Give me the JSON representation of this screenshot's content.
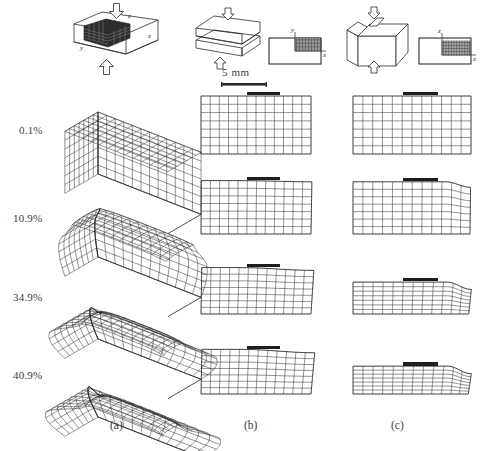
{
  "figure": {
    "width": 494,
    "height": 451,
    "background": "#ffffff",
    "ink_color": "#2a2a2a"
  },
  "strain_levels": [
    {
      "label": "0.1%",
      "value": 0.1
    },
    {
      "label": "10.9%",
      "value": 10.9
    },
    {
      "label": "34.9%",
      "value": 34.9
    },
    {
      "label": "40.9%",
      "value": 40.9
    }
  ],
  "columns": [
    {
      "id": "a",
      "caption": "(a)",
      "view": "3D isometric mesh"
    },
    {
      "id": "b",
      "caption": "(b)",
      "view": "x-y cross-section mesh"
    },
    {
      "id": "c",
      "caption": "(c)",
      "view": "x-z cross-section mesh"
    }
  ],
  "scale_bar": {
    "label": "5 mm"
  },
  "axes": {
    "column_b": {
      "vertical": "y",
      "horizontal": "x"
    },
    "column_c": {
      "vertical": "z",
      "horizontal": "x"
    }
  },
  "icons": {
    "compression_arrow": "compression-arrow-icon",
    "specimen_block": "specimen-block-icon",
    "section_plane": "section-plane-icon"
  },
  "chart_data": {
    "type": "diagram",
    "categories": [
      "0.1%",
      "10.9%",
      "34.9%",
      "40.9%"
    ],
    "series": [
      {
        "name": "(a) 3D isometric mesh",
        "grid": {
          "nx": 12,
          "ny": 7,
          "nz": 7
        },
        "values": [
          {
            "strain": "0.1%",
            "height_fraction": 1.0,
            "edge_rounding": 0.0,
            "barrel": 0.0
          },
          {
            "strain": "10.9%",
            "height_fraction": 0.89,
            "edge_rounding": 0.3,
            "barrel": 0.1
          },
          {
            "strain": "34.9%",
            "height_fraction": 0.65,
            "edge_rounding": 0.7,
            "barrel": 0.26
          },
          {
            "strain": "40.9%",
            "height_fraction": 0.59,
            "edge_rounding": 0.85,
            "barrel": 0.32
          }
        ]
      },
      {
        "name": "(b) x-y cross-section mesh",
        "grid": {
          "nx": 12,
          "ny": 7
        },
        "values": [
          {
            "strain": "0.1%",
            "height_fraction": 1.0,
            "top_tilt": 0.0,
            "shear": 0.0
          },
          {
            "strain": "10.9%",
            "height_fraction": 0.92,
            "top_tilt": 0.04,
            "shear": 0.05
          },
          {
            "strain": "34.9%",
            "height_fraction": 0.8,
            "top_tilt": 0.11,
            "shear": 0.16
          },
          {
            "strain": "40.9%",
            "height_fraction": 0.77,
            "top_tilt": 0.14,
            "shear": 0.21
          }
        ]
      },
      {
        "name": "(c) x-z cross-section mesh",
        "grid": {
          "nx": 12,
          "nz": 7
        },
        "values": [
          {
            "strain": "0.1%",
            "height_fraction": 1.0,
            "corner_round": 0.0,
            "flatten": 0.0
          },
          {
            "strain": "10.9%",
            "height_fraction": 0.9,
            "corner_round": 0.25,
            "flatten": 0.1
          },
          {
            "strain": "34.9%",
            "height_fraction": 0.55,
            "corner_round": 0.55,
            "flatten": 0.45
          },
          {
            "strain": "40.9%",
            "height_fraction": 0.48,
            "corner_round": 0.65,
            "flatten": 0.52
          }
        ]
      }
    ],
    "xlabel": "x",
    "ylabel": "y / z",
    "grid": true,
    "legend_position": "none",
    "annotations": [
      "5 mm scale bar above each cross-section panel"
    ]
  }
}
